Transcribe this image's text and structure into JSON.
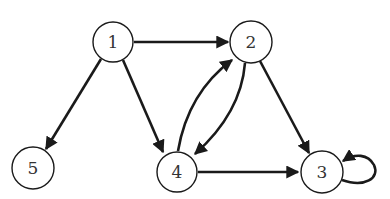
{
  "graph": {
    "type": "directed",
    "nodes": [
      {
        "id": "1",
        "label": "1",
        "x": 113,
        "y": 42
      },
      {
        "id": "2",
        "label": "2",
        "x": 251,
        "y": 42
      },
      {
        "id": "3",
        "label": "3",
        "x": 322,
        "y": 172
      },
      {
        "id": "4",
        "label": "4",
        "x": 177,
        "y": 172
      },
      {
        "id": "5",
        "label": "5",
        "x": 33,
        "y": 168
      }
    ],
    "edges": [
      {
        "from": "1",
        "to": "2"
      },
      {
        "from": "1",
        "to": "5"
      },
      {
        "from": "1",
        "to": "4"
      },
      {
        "from": "2",
        "to": "4"
      },
      {
        "from": "4",
        "to": "2"
      },
      {
        "from": "2",
        "to": "3"
      },
      {
        "from": "4",
        "to": "3"
      },
      {
        "from": "3",
        "to": "3"
      }
    ],
    "colors": {
      "stroke": "#1a1a1a",
      "fill": "#ffffff",
      "label": "#333333"
    }
  }
}
